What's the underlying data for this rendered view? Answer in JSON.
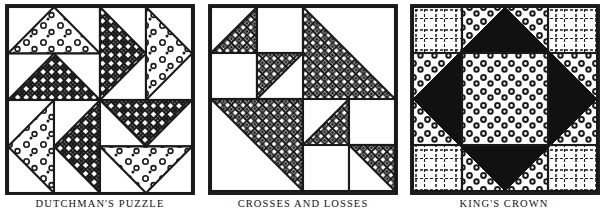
{
  "page": {
    "kind": "quilt-block-pattern-plate",
    "background_color": "#ffffff",
    "ink_color": "#1a1a1a",
    "width": 604,
    "height": 212
  },
  "blocks": [
    {
      "id": "dutchmans-puzzle",
      "caption": "DUTCHMAN'S PUZZLE",
      "grid": "4x4 (four quadrants of two stacked flying-geese units)",
      "unit_type": "flying-geese",
      "rotation": "pinwheel",
      "fabrics": [
        "dotted-light",
        "basketweave-dark"
      ],
      "frame_color": "#1a1a1a"
    },
    {
      "id": "crosses-and-losses",
      "caption": "CROSSES AND LOSSES",
      "grid": "4x4 half-square-triangles and plain squares",
      "unit_type": "half-square-triangle",
      "fabrics": [
        "diamond-lattice",
        "plain-white"
      ],
      "frame_color": "#1a1a1a"
    },
    {
      "id": "kings-crown",
      "caption": "KING'S CROWN",
      "grid": "3x3 with narrow outer bands and large center square",
      "unit_type": "square-in-a-diamond",
      "fabrics": [
        "plaid-light",
        "ring-dot",
        "solid-black"
      ],
      "frame_color": "#1a1a1a"
    }
  ]
}
